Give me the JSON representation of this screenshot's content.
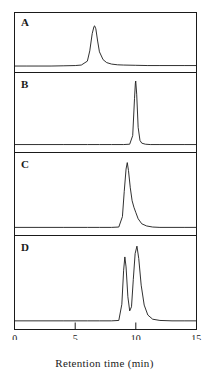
{
  "figure": {
    "type": "chromatogram-panel-figure",
    "panels_count": 4
  },
  "axis": {
    "xlabel": "Retention time (min)",
    "tick_labels": [
      "0",
      "5",
      "10",
      "15"
    ],
    "tick_values": [
      0,
      5,
      10,
      15
    ],
    "xlim": [
      0,
      15
    ],
    "ticks_inward": true
  },
  "panels": [
    {
      "letter": "A"
    },
    {
      "letter": "B"
    },
    {
      "letter": "C"
    },
    {
      "letter": "D"
    }
  ],
  "chart_data": {
    "type": "line",
    "title": "",
    "xlabel": "Retention time (min)",
    "ylabel": "",
    "xlim": [
      0,
      15
    ],
    "grid": false,
    "legend": "none",
    "subplots_layout": "4 stacked panels sharing one x-axis",
    "series": [
      {
        "name": "A",
        "panel": "A",
        "ylim": [
          0,
          1
        ],
        "baseline": 0.04,
        "peaks": [
          {
            "retention_time": 6.6,
            "height": 0.86,
            "width": 0.42,
            "tailing": 0.9,
            "label": "main peak"
          }
        ],
        "x": [
          0,
          1,
          2,
          3,
          4,
          5,
          5.5,
          6,
          6.2,
          6.4,
          6.55,
          6.6,
          6.7,
          6.85,
          7.0,
          7.3,
          7.6,
          8,
          8.5,
          9,
          10,
          11,
          12,
          13,
          14,
          15
        ],
        "y": [
          0.04,
          0.04,
          0.04,
          0.04,
          0.045,
          0.05,
          0.06,
          0.14,
          0.35,
          0.7,
          0.85,
          0.86,
          0.8,
          0.55,
          0.33,
          0.17,
          0.11,
          0.08,
          0.065,
          0.06,
          0.055,
          0.05,
          0.05,
          0.05,
          0.05,
          0.05
        ]
      },
      {
        "name": "B",
        "panel": "B",
        "ylim": [
          0,
          1
        ],
        "baseline": 0.04,
        "peaks": [
          {
            "retention_time": 10.0,
            "height": 0.97,
            "width": 0.16,
            "tailing": 0.3,
            "label": "main peak"
          }
        ],
        "x": [
          0,
          2,
          4,
          6,
          7,
          8,
          9,
          9.5,
          9.75,
          9.9,
          9.97,
          10.0,
          10.08,
          10.2,
          10.35,
          10.5,
          10.8,
          11.2,
          12,
          13,
          14,
          15
        ],
        "y": [
          0.05,
          0.05,
          0.05,
          0.05,
          0.05,
          0.05,
          0.05,
          0.055,
          0.18,
          0.72,
          0.94,
          0.97,
          0.78,
          0.3,
          0.11,
          0.07,
          0.055,
          0.05,
          0.05,
          0.05,
          0.05,
          0.05
        ]
      },
      {
        "name": "C",
        "panel": "C",
        "ylim": [
          0,
          1
        ],
        "baseline": 0.04,
        "peaks": [
          {
            "retention_time": 9.3,
            "height": 0.95,
            "width": 0.22,
            "tailing": 1.6,
            "label": "main peak with tailing shoulder"
          }
        ],
        "x": [
          0,
          2,
          4,
          6,
          7,
          8,
          8.6,
          8.9,
          9.05,
          9.2,
          9.3,
          9.4,
          9.55,
          9.7,
          9.85,
          10.0,
          10.2,
          10.5,
          10.9,
          11.4,
          12,
          13,
          14,
          15
        ],
        "y": [
          0.05,
          0.05,
          0.05,
          0.05,
          0.05,
          0.05,
          0.055,
          0.2,
          0.55,
          0.86,
          0.95,
          0.84,
          0.6,
          0.42,
          0.33,
          0.26,
          0.17,
          0.1,
          0.07,
          0.055,
          0.05,
          0.05,
          0.05,
          0.05
        ]
      },
      {
        "name": "D",
        "panel": "D",
        "ylim": [
          0,
          1
        ],
        "baseline": 0.04,
        "peaks": [
          {
            "retention_time": 9.1,
            "height": 0.82,
            "width": 0.2,
            "tailing": 0.6,
            "label": "first peak"
          },
          {
            "retention_time": 10.1,
            "height": 0.95,
            "width": 0.24,
            "tailing": 1.0,
            "label": "second peak"
          }
        ],
        "x": [
          0,
          2,
          4,
          6,
          7,
          8,
          8.6,
          8.85,
          9.0,
          9.1,
          9.2,
          9.35,
          9.5,
          9.65,
          9.8,
          9.95,
          10.1,
          10.25,
          10.45,
          10.7,
          11.0,
          11.4,
          12,
          13,
          14,
          15
        ],
        "y": [
          0.05,
          0.05,
          0.05,
          0.05,
          0.05,
          0.05,
          0.055,
          0.25,
          0.66,
          0.82,
          0.7,
          0.34,
          0.17,
          0.22,
          0.55,
          0.86,
          0.95,
          0.8,
          0.48,
          0.24,
          0.12,
          0.07,
          0.055,
          0.05,
          0.05,
          0.05
        ]
      }
    ]
  }
}
